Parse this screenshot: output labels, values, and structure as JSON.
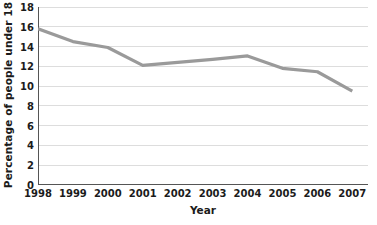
{
  "chart_data": {
    "type": "line",
    "title": "",
    "subtitle": "",
    "xlabel": "Year",
    "ylabel": "Percentage of people under 18",
    "categories": [
      "1998",
      "1999",
      "2000",
      "2001",
      "2002",
      "2003",
      "2004",
      "2005",
      "2006",
      "2007"
    ],
    "x": [
      1998,
      1999,
      2000,
      2001,
      2002,
      2003,
      2004,
      2005,
      2006,
      2007
    ],
    "values": [
      15.8,
      14.5,
      13.9,
      12.1,
      12.4,
      12.7,
      13.05,
      11.8,
      11.45,
      9.5
    ],
    "series": [
      {
        "name": "Percentage of people under 18",
        "values": [
          15.8,
          14.5,
          13.9,
          12.1,
          12.4,
          12.7,
          13.05,
          11.8,
          11.45,
          9.5
        ]
      }
    ],
    "ylim": [
      0,
      18
    ],
    "xlim": [
      1998,
      2007.45
    ],
    "ytick_labels": [
      "0",
      "2",
      "4",
      "6",
      "8",
      "10",
      "12",
      "14",
      "16",
      "18"
    ],
    "ytick_values": [
      0,
      2,
      4,
      6,
      8,
      10,
      12,
      14,
      16,
      18
    ],
    "xtick_labels": [
      "1998",
      "1999",
      "2000",
      "2001",
      "2002",
      "2003",
      "2004",
      "2005",
      "2006",
      "2007"
    ],
    "grid": "horizontal",
    "legend": "none",
    "line_color": "#9a9a9a",
    "grid_color": "#dddddd",
    "axis_color": "#555555",
    "text_color": "#1b1b1b",
    "background_color": "#ffffff",
    "annotations": []
  }
}
